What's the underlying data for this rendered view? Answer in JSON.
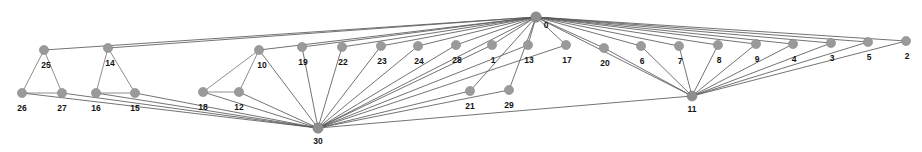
{
  "figure": {
    "background_color": "#ffffff",
    "node_color": "#9a9a9a",
    "edge_color": "#6e6e6e",
    "label_color": "#141414",
    "width": 922,
    "height": 152
  },
  "chart_data": {
    "type": "graph",
    "title": "",
    "xlabel": "",
    "ylabel": "",
    "directed": false,
    "node_count": 31,
    "edge_count": 60,
    "nodes": [
      {
        "id": "0",
        "label": "0",
        "x": 536,
        "y": 17,
        "label_dx": 10,
        "label_dy": 9,
        "r": 5.2,
        "hub": true
      },
      {
        "id": "30",
        "label": "30",
        "x": 318,
        "y": 128,
        "label_dx": 0,
        "label_dy": 14,
        "r": 5.2,
        "hub": true
      },
      {
        "id": "11",
        "label": "11",
        "x": 692,
        "y": 96,
        "label_dx": 0,
        "label_dy": 14,
        "r": 5.0,
        "hub": true
      },
      {
        "id": "25",
        "label": "25",
        "x": 44,
        "y": 50,
        "label_dx": 2,
        "label_dy": 16,
        "r": 4.6,
        "hub": false
      },
      {
        "id": "14",
        "label": "14",
        "x": 108,
        "y": 48,
        "label_dx": 2,
        "label_dy": 16,
        "r": 4.6,
        "hub": false
      },
      {
        "id": "26",
        "label": "26",
        "x": 22,
        "y": 93,
        "label_dx": 0,
        "label_dy": 16,
        "r": 4.6,
        "hub": false
      },
      {
        "id": "27",
        "label": "27",
        "x": 62,
        "y": 93,
        "label_dx": 0,
        "label_dy": 16,
        "r": 4.6,
        "hub": false
      },
      {
        "id": "16",
        "label": "16",
        "x": 96,
        "y": 93,
        "label_dx": 0,
        "label_dy": 16,
        "r": 4.6,
        "hub": false
      },
      {
        "id": "15",
        "label": "15",
        "x": 135,
        "y": 93,
        "label_dx": 0,
        "label_dy": 16,
        "r": 4.6,
        "hub": false
      },
      {
        "id": "18",
        "label": "18",
        "x": 203,
        "y": 92,
        "label_dx": 0,
        "label_dy": 16,
        "r": 4.6,
        "hub": false
      },
      {
        "id": "12",
        "label": "12",
        "x": 239,
        "y": 92,
        "label_dx": 0,
        "label_dy": 16,
        "r": 4.6,
        "hub": false
      },
      {
        "id": "10",
        "label": "10",
        "x": 259,
        "y": 50,
        "label_dx": 3,
        "label_dy": 16,
        "r": 4.6,
        "hub": false
      },
      {
        "id": "19",
        "label": "19",
        "x": 302,
        "y": 47,
        "label_dx": 1,
        "label_dy": 16,
        "r": 4.6,
        "hub": false
      },
      {
        "id": "22",
        "label": "22",
        "x": 342,
        "y": 47,
        "label_dx": 1,
        "label_dy": 16,
        "r": 4.6,
        "hub": false
      },
      {
        "id": "23",
        "label": "23",
        "x": 381,
        "y": 46,
        "label_dx": 1,
        "label_dy": 16,
        "r": 4.6,
        "hub": false
      },
      {
        "id": "24",
        "label": "24",
        "x": 418,
        "y": 46,
        "label_dx": 1,
        "label_dy": 16,
        "r": 4.6,
        "hub": false
      },
      {
        "id": "28",
        "label": "28",
        "x": 456,
        "y": 45,
        "label_dx": 1,
        "label_dy": 16,
        "r": 4.6,
        "hub": false
      },
      {
        "id": "1",
        "label": "1",
        "x": 492,
        "y": 45,
        "label_dx": 1,
        "label_dy": 16,
        "r": 4.6,
        "hub": false
      },
      {
        "id": "13",
        "label": "13",
        "x": 528,
        "y": 45,
        "label_dx": 1,
        "label_dy": 16,
        "r": 4.6,
        "hub": false
      },
      {
        "id": "17",
        "label": "17",
        "x": 566,
        "y": 45,
        "label_dx": 1,
        "label_dy": 16,
        "r": 4.6,
        "hub": false
      },
      {
        "id": "20",
        "label": "20",
        "x": 604,
        "y": 48,
        "label_dx": 1,
        "label_dy": 16,
        "r": 4.6,
        "hub": false
      },
      {
        "id": "6",
        "label": "6",
        "x": 641,
        "y": 46,
        "label_dx": 1,
        "label_dy": 16,
        "r": 4.6,
        "hub": false
      },
      {
        "id": "7",
        "label": "7",
        "x": 679,
        "y": 46,
        "label_dx": 1,
        "label_dy": 16,
        "r": 4.6,
        "hub": false
      },
      {
        "id": "8",
        "label": "8",
        "x": 718,
        "y": 45,
        "label_dx": 1,
        "label_dy": 16,
        "r": 4.6,
        "hub": false
      },
      {
        "id": "9",
        "label": "9",
        "x": 756,
        "y": 44,
        "label_dx": 1,
        "label_dy": 16,
        "r": 4.6,
        "hub": false
      },
      {
        "id": "4",
        "label": "4",
        "x": 793,
        "y": 44,
        "label_dx": 1,
        "label_dy": 16,
        "r": 4.6,
        "hub": false
      },
      {
        "id": "3",
        "label": "3",
        "x": 831,
        "y": 43,
        "label_dx": 1,
        "label_dy": 16,
        "r": 4.6,
        "hub": false
      },
      {
        "id": "5",
        "label": "5",
        "x": 868,
        "y": 42,
        "label_dx": 1,
        "label_dy": 16,
        "r": 4.6,
        "hub": false
      },
      {
        "id": "2",
        "label": "2",
        "x": 906,
        "y": 41,
        "label_dx": 1,
        "label_dy": 16,
        "r": 4.6,
        "hub": false
      },
      {
        "id": "21",
        "label": "21",
        "x": 470,
        "y": 91,
        "label_dx": 0,
        "label_dy": 16,
        "r": 4.6,
        "hub": false
      },
      {
        "id": "29",
        "label": "29",
        "x": 509,
        "y": 90,
        "label_dx": 0,
        "label_dy": 16,
        "r": 4.6,
        "hub": false
      }
    ],
    "edges": [
      [
        "0",
        "25"
      ],
      [
        "0",
        "14"
      ],
      [
        "0",
        "10"
      ],
      [
        "0",
        "19"
      ],
      [
        "0",
        "22"
      ],
      [
        "0",
        "23"
      ],
      [
        "0",
        "24"
      ],
      [
        "0",
        "28"
      ],
      [
        "0",
        "1"
      ],
      [
        "0",
        "13"
      ],
      [
        "0",
        "17"
      ],
      [
        "0",
        "20"
      ],
      [
        "0",
        "6"
      ],
      [
        "0",
        "7"
      ],
      [
        "0",
        "8"
      ],
      [
        "0",
        "9"
      ],
      [
        "0",
        "4"
      ],
      [
        "0",
        "3"
      ],
      [
        "0",
        "5"
      ],
      [
        "0",
        "2"
      ],
      [
        "0",
        "11"
      ],
      [
        "0",
        "30"
      ],
      [
        "0",
        "21"
      ],
      [
        "0",
        "29"
      ],
      [
        "30",
        "26"
      ],
      [
        "30",
        "27"
      ],
      [
        "30",
        "16"
      ],
      [
        "30",
        "15"
      ],
      [
        "30",
        "18"
      ],
      [
        "30",
        "12"
      ],
      [
        "30",
        "10"
      ],
      [
        "30",
        "19"
      ],
      [
        "30",
        "22"
      ],
      [
        "30",
        "23"
      ],
      [
        "30",
        "24"
      ],
      [
        "30",
        "28"
      ],
      [
        "30",
        "1"
      ],
      [
        "30",
        "13"
      ],
      [
        "30",
        "17"
      ],
      [
        "30",
        "21"
      ],
      [
        "30",
        "29"
      ],
      [
        "30",
        "11"
      ],
      [
        "11",
        "20"
      ],
      [
        "11",
        "6"
      ],
      [
        "11",
        "7"
      ],
      [
        "11",
        "8"
      ],
      [
        "11",
        "9"
      ],
      [
        "11",
        "4"
      ],
      [
        "11",
        "3"
      ],
      [
        "11",
        "5"
      ],
      [
        "11",
        "2"
      ],
      [
        "25",
        "26"
      ],
      [
        "25",
        "27"
      ],
      [
        "26",
        "27"
      ],
      [
        "14",
        "16"
      ],
      [
        "14",
        "15"
      ],
      [
        "16",
        "15"
      ],
      [
        "10",
        "18"
      ],
      [
        "10",
        "12"
      ],
      [
        "18",
        "12"
      ]
    ]
  }
}
